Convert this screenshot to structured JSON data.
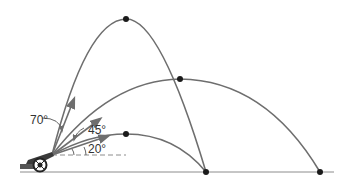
{
  "diagram": {
    "colors": {
      "trajectory": "#6e6e6e",
      "ground": "#8c8c8c",
      "point": "#1a1a1a",
      "text": "#333333"
    },
    "origin": {
      "x": 52,
      "y": 155
    },
    "ground_y": 172,
    "trajectories": [
      {
        "angle_label": "70°",
        "angle_deg": 70,
        "peak": {
          "x": 126,
          "y": 19
        },
        "landing": {
          "x": 206,
          "y": 172
        }
      },
      {
        "angle_label": "45°",
        "angle_deg": 45,
        "peak": {
          "x": 180,
          "y": 79
        },
        "landing": {
          "x": 320,
          "y": 172
        }
      },
      {
        "angle_label": "20°",
        "angle_deg": 20,
        "peak": {
          "x": 126,
          "y": 134
        },
        "landing": {
          "x": 206,
          "y": 172
        }
      }
    ],
    "labels": {
      "angle_70": "70°",
      "angle_45": "45°",
      "angle_20": "20°"
    },
    "launcher": "cannon-on-wheels"
  }
}
